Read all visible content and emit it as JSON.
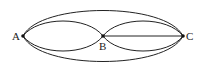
{
  "diagram": {
    "type": "multigraph",
    "nodes": [
      {
        "id": "A",
        "label": "A"
      },
      {
        "id": "B",
        "label": "B"
      },
      {
        "id": "C",
        "label": "C"
      }
    ],
    "edges": [
      {
        "from": "A",
        "to": "B",
        "shape": "upper-arc"
      },
      {
        "from": "A",
        "to": "B",
        "shape": "lower-arc"
      },
      {
        "from": "B",
        "to": "C",
        "shape": "upper-arc"
      },
      {
        "from": "B",
        "to": "C",
        "shape": "straight"
      },
      {
        "from": "B",
        "to": "C",
        "shape": "lower-arc"
      },
      {
        "from": "A",
        "to": "C",
        "shape": "upper-arc"
      },
      {
        "from": "A",
        "to": "C",
        "shape": "lower-arc"
      }
    ],
    "colors": {
      "stroke": "#222222",
      "background": "#ffffff"
    }
  }
}
